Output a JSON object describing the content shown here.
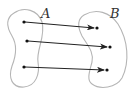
{
  "diagram": {
    "type": "function-mapping",
    "colors": {
      "blob_stroke": "#b5b5b5",
      "arrow": "#222222",
      "point": "#111111",
      "label": "#333333"
    },
    "sets": [
      {
        "id": "A",
        "label": "A"
      },
      {
        "id": "B",
        "label": "B"
      }
    ],
    "mappings": [
      {
        "from": "A.1",
        "to": "B.1"
      },
      {
        "from": "A.2",
        "to": "B.2"
      },
      {
        "from": "A.3",
        "to": "B.3"
      }
    ]
  }
}
